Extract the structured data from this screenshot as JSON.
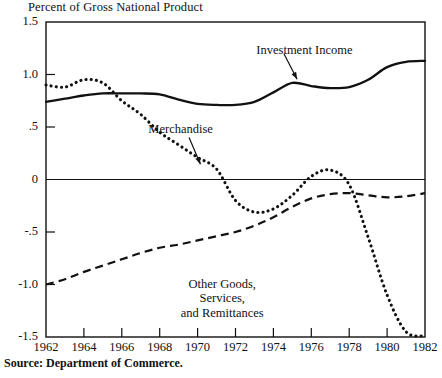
{
  "title": "Percent of Gross National Product",
  "source_note": "Source: Department of Commerce.",
  "axes": {
    "y_ticks": [
      "1.5",
      "1.0",
      ".5",
      "0",
      "-.5",
      "-1.0",
      "-1.5"
    ],
    "x_ticks": [
      "1962",
      "1964",
      "1966",
      "1968",
      "1970",
      "1972",
      "1974",
      "1976",
      "1978",
      "1980",
      "1982"
    ]
  },
  "labels": {
    "investment_income": "Investment Income",
    "merchandise": "Merchandise",
    "other_goods_line1": "Other Goods,",
    "other_goods_line2": "Services,",
    "other_goods_line3": "and Remittances"
  },
  "colors": {
    "ink": "#111111",
    "background": "#ffffff"
  },
  "chart_data": {
    "type": "line",
    "title": "Percent of Gross National Product",
    "subtitle": "",
    "xlabel": "",
    "ylabel": "Percent of Gross National Product",
    "xlim": [
      1962,
      1982
    ],
    "ylim": [
      -1.5,
      1.5
    ],
    "grid": false,
    "legend": "inline-annotations",
    "zero_line": 0,
    "annotations": [
      {
        "text": "Investment Income",
        "x": 1975.0,
        "y": 1.28,
        "points_to": {
          "x": 1975.2,
          "y": 0.93
        }
      },
      {
        "text": "Merchandise",
        "x": 1968.9,
        "y": 0.46,
        "points_to": {
          "x": 1970.2,
          "y": 0.12
        }
      },
      {
        "text": "Other Goods, Services, and Remittances",
        "x": 1971.2,
        "y": -1.06
      }
    ],
    "x": [
      1962,
      1963,
      1964,
      1965,
      1966,
      1967,
      1968,
      1969,
      1970,
      1971,
      1972,
      1973,
      1974,
      1975,
      1976,
      1977,
      1978,
      1979,
      1980,
      1981,
      1982
    ],
    "series": [
      {
        "name": "Investment Income",
        "style": "solid",
        "values": [
          0.74,
          0.77,
          0.8,
          0.82,
          0.82,
          0.82,
          0.81,
          0.76,
          0.72,
          0.71,
          0.71,
          0.74,
          0.83,
          0.92,
          0.89,
          0.87,
          0.88,
          0.95,
          1.07,
          1.12,
          1.13
        ]
      },
      {
        "name": "Merchandise",
        "style": "dotted",
        "values": [
          0.9,
          0.88,
          0.95,
          0.92,
          0.75,
          0.62,
          0.45,
          0.33,
          0.21,
          0.1,
          -0.2,
          -0.31,
          -0.28,
          -0.15,
          0.03,
          0.09,
          -0.05,
          -0.55,
          -1.1,
          -1.45,
          -1.49
        ]
      },
      {
        "name": "Other Goods, Services, and Remittances",
        "style": "dashed",
        "values": [
          -1.0,
          -0.95,
          -0.88,
          -0.82,
          -0.76,
          -0.7,
          -0.65,
          -0.62,
          -0.58,
          -0.54,
          -0.5,
          -0.44,
          -0.36,
          -0.26,
          -0.18,
          -0.14,
          -0.13,
          -0.15,
          -0.17,
          -0.16,
          -0.13
        ]
      }
    ]
  }
}
